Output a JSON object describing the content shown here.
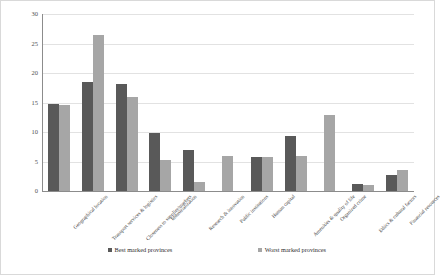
{
  "chart_data": {
    "type": "bar",
    "title": "",
    "xlabel": "",
    "ylabel": "",
    "ylim": [
      0,
      30
    ],
    "yticks": [
      0,
      5,
      10,
      15,
      20,
      25,
      30
    ],
    "grid": true,
    "legend_position": "bottom",
    "categories": [
      "Geographical location",
      "Transport services & logistics",
      "Closeness to supplier/markets",
      "Industrialization",
      "Research & innovation",
      "Public institutions",
      "Human capital",
      "Amenities & quality of life",
      "Organized crime",
      "Ethics & cultural factors",
      "Financial resources"
    ],
    "series": [
      {
        "name": "Best marked provinces",
        "color": "#595959",
        "values": [
          14.8,
          18.5,
          18.2,
          9.8,
          6.9,
          0,
          5.8,
          9.3,
          0,
          1.2,
          2.7
        ]
      },
      {
        "name": "Worst marked provinces",
        "color": "#a6a6a6",
        "values": [
          14.6,
          26.4,
          16.0,
          5.2,
          1.6,
          6.0,
          5.8,
          6.0,
          12.8,
          1.0,
          3.5
        ]
      }
    ]
  },
  "legend": {
    "items": [
      {
        "label": "Best marked provinces",
        "color": "#595959"
      },
      {
        "label": "Worst marked provinces",
        "color": "#a6a6a6"
      }
    ]
  }
}
